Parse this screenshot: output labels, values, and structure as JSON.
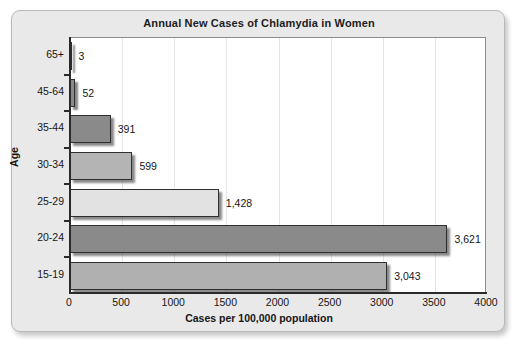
{
  "chart_data": {
    "type": "bar",
    "orientation": "horizontal",
    "title": "Annual New Cases of Chlamydia in Women",
    "xlabel": "Cases per 100,000 population",
    "ylabel": "Age",
    "categories": [
      "65+",
      "45-64",
      "35-44",
      "30-34",
      "25-29",
      "20-24",
      "15-19"
    ],
    "values": [
      3,
      52,
      391,
      599,
      1428,
      3621,
      3043
    ],
    "value_labels": [
      "3",
      "52",
      "391",
      "599",
      "1,428",
      "3,621",
      "3,043"
    ],
    "bar_colors": [
      "#8a8a8a",
      "#8a8a8a",
      "#8a8a8a",
      "#b4b4b4",
      "#e2e2e2",
      "#8a8a8a",
      "#b0b0b0"
    ],
    "xlim": [
      0,
      4000
    ],
    "xticks": [
      0,
      500,
      1000,
      1500,
      2000,
      2500,
      3000,
      3500,
      4000
    ],
    "xtick_labels": [
      "0",
      "500",
      "1000",
      "1500",
      "2000",
      "2500",
      "3000",
      "3500",
      "4000"
    ],
    "grid": true,
    "grid_axis": "x",
    "legend": false,
    "plot_background": "#ffffff",
    "card_background": "#e9e9e9",
    "axis_color": "#2a2a2a",
    "gridline_color": "#e4e4e4"
  }
}
